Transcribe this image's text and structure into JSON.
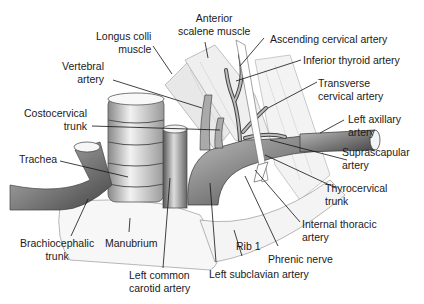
{
  "figure": {
    "type": "anatomical illustration",
    "labels": {
      "longus_colli": [
        "Longus colli",
        "muscle"
      ],
      "anterior_scalene": [
        "Anterior",
        "scalene muscle"
      ],
      "ascending_cervical": "Ascending cervical artery",
      "inferior_thyroid": "Inferior thyroid artery",
      "vertebral": [
        "Vertebral",
        "artery"
      ],
      "transverse_cervical": [
        "Transverse",
        "cervical artery"
      ],
      "costocervical": [
        "Costocervical",
        "trunk"
      ],
      "left_axillary": [
        "Left axillary",
        "artery"
      ],
      "trachea": "Trachea",
      "suprascapular": [
        "Suprascapular",
        "artery"
      ],
      "thyrocervical": [
        "Thyrocervical",
        "trunk"
      ],
      "internal_thoracic": [
        "Internal thoracic",
        "artery"
      ],
      "brachiocephalic": [
        "Brachiocephalic",
        "trunk"
      ],
      "manubrium": "Manubrium",
      "rib1": "Rib 1",
      "phrenic": "Phrenic nerve",
      "left_common_carotid": [
        "Left common",
        "carotid artery"
      ],
      "left_subclavian": "Left subclavian artery"
    }
  }
}
